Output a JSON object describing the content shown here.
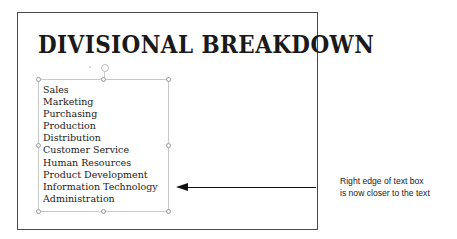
{
  "slide": {
    "title": "DIVISIONAL BREAKDOWN",
    "textbox": {
      "items": [
        "Sales",
        "Marketing",
        "Purchasing",
        "Production",
        "Distribution",
        "Customer Service",
        "Human Resources",
        "Product Development",
        "Information Technology",
        "Administration"
      ]
    }
  },
  "callout": {
    "line1": "Right edge of text box",
    "line2": "is now closer to the text"
  },
  "colors": {
    "frame": "#4a4a4a",
    "textbox_border": "#c8c8c8",
    "arrow": "#111111",
    "text": "#222222"
  }
}
